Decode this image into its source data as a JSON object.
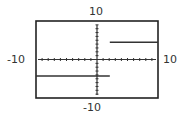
{
  "chart_data": {
    "type": "line",
    "title": "",
    "xlabel": "",
    "ylabel": "",
    "xlim": [
      -10,
      10
    ],
    "ylim": [
      -10,
      10
    ],
    "grid": false,
    "axis_tick_step": 1,
    "tick_labels": {
      "x_min": "-10",
      "x_max": "10",
      "y_min": "-10",
      "y_max": "10"
    },
    "series": [
      {
        "name": "lower-step",
        "points": [
          [
            -10,
            -4.3
          ],
          [
            2.1,
            -4.3
          ]
        ]
      },
      {
        "name": "upper-step",
        "points": [
          [
            2.1,
            4.5
          ],
          [
            10,
            4.5
          ]
        ]
      }
    ],
    "line_color": "#333333",
    "frame_color": "#222222"
  },
  "labels": {
    "y_max": "10",
    "y_min": "-10",
    "x_min": "-10",
    "x_max": "10"
  }
}
